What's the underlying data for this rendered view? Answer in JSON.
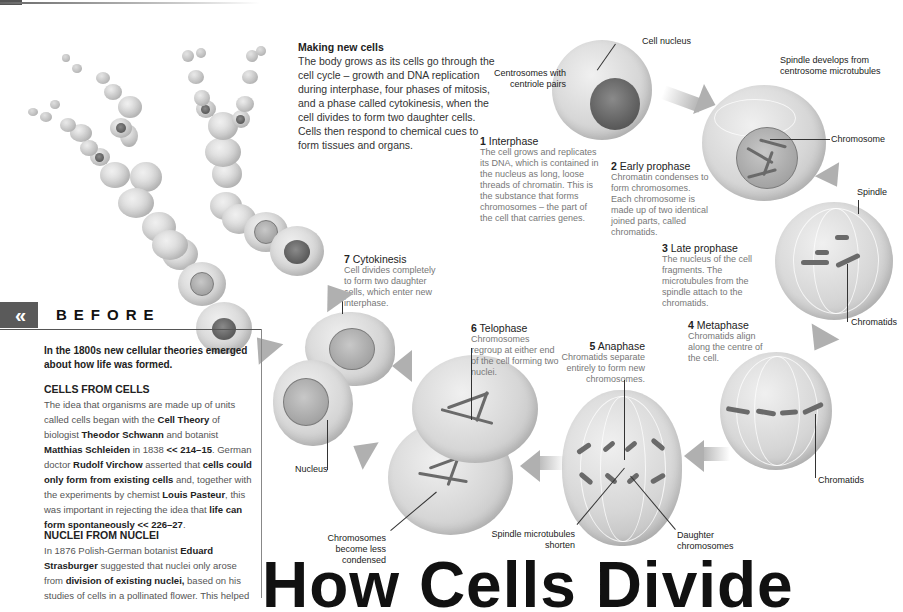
{
  "intro": {
    "heading": "Making new cells",
    "body": "The body grows as its cells go through the cell cycle – growth and DNA replication during interphase, four phases of mitosis, and a phase called cytokinesis, when the cell divides to form two daughter cells. Cells then respond to chemical cues to form tissues and organs."
  },
  "stages": [
    {
      "num": "1",
      "name": "Interphase",
      "body": "The cell grows and replicates its DNA, which is contained in the nucleus as long, loose threads of chromatin. This is the substance that forms chromosomes – the part of the cell that carries genes."
    },
    {
      "num": "2",
      "name": "Early prophase",
      "body": "Chromatin condenses to form chromosomes. Each chromosome is made up of two identical joined parts, called chromatids."
    },
    {
      "num": "3",
      "name": "Late prophase",
      "body": "The nucleus of the cell fragments. The microtubules from the spindle attach to the chromatids."
    },
    {
      "num": "4",
      "name": "Metaphase",
      "body": "Chromatids align along the centre of the cell."
    },
    {
      "num": "5",
      "name": "Anaphase",
      "body": "Chromatids separate entirely to form new chromosomes."
    },
    {
      "num": "6",
      "name": "Telophase",
      "body": "Chromosomes regroup at either end of the cell forming two nuclei."
    },
    {
      "num": "7",
      "name": "Cytokinesis",
      "body": "Cell divides completely to form two daughter cells, which enter new interphase."
    }
  ],
  "labels": {
    "cell_nucleus": "Cell nucleus",
    "centrosomes": "Centrosomes with centriole pairs",
    "spindle_develops": "Spindle develops from centrosome microtubules",
    "chromosome": "Chromosome",
    "spindle": "Spindle",
    "chromatids_1": "Chromatids",
    "chromatids_2": "Chromatids",
    "daughter_chromosomes": "Daughter chromosomes",
    "spindle_shorten": "Spindle microtubules shorten",
    "chromosomes_less": "Chromosomes become less condensed",
    "nucleus": "Nucleus"
  },
  "before": {
    "icon": "«",
    "title": "BEFORE",
    "lead": "In the 1800s new cellular theories emerged about how life was formed.",
    "sections": [
      {
        "heading": "CELLS FROM CELLS",
        "parts": [
          {
            "t": "The idea that organisms are made up of units called cells began with the ",
            "b": false
          },
          {
            "t": "Cell Theory",
            "b": true
          },
          {
            "t": " of biologist ",
            "b": false
          },
          {
            "t": "Theodor Schwann",
            "b": true
          },
          {
            "t": " and botanist ",
            "b": false
          },
          {
            "t": "Matthias Schleiden",
            "b": true
          },
          {
            "t": " in 1838 ",
            "b": false
          },
          {
            "t": "<< 214–15",
            "b": true
          },
          {
            "t": ". German doctor ",
            "b": false
          },
          {
            "t": "Rudolf Virchow",
            "b": true
          },
          {
            "t": " asserted that ",
            "b": false
          },
          {
            "t": "cells could only form from existing cells",
            "b": true
          },
          {
            "t": " and, together with the experiments by chemist ",
            "b": false
          },
          {
            "t": "Louis Pasteur",
            "b": true
          },
          {
            "t": ", this was important in rejecting the idea that ",
            "b": false
          },
          {
            "t": "life can form spontaneously << 226–27",
            "b": true
          },
          {
            "t": ".",
            "b": false
          }
        ]
      },
      {
        "heading": "NUCLEI FROM NUCLEI",
        "parts": [
          {
            "t": "In 1876 Polish-German botanist ",
            "b": false
          },
          {
            "t": "Eduard Strasburger",
            "b": true
          },
          {
            "t": " suggested that nuclei only arose from ",
            "b": false
          },
          {
            "t": "division of existing nuclei,",
            "b": true
          },
          {
            "t": " based on his studies of cells in a pollinated flower. This helped",
            "b": false
          }
        ]
      }
    ]
  },
  "page_title": "How Cells Divide",
  "colors": {
    "cell_gray": "#d0d0d0",
    "nucleus_dark": "#5a5a5a",
    "arrow_gray": "#b0b0b0",
    "text_gray": "#777777",
    "before_bar": "#5a5a5a"
  }
}
